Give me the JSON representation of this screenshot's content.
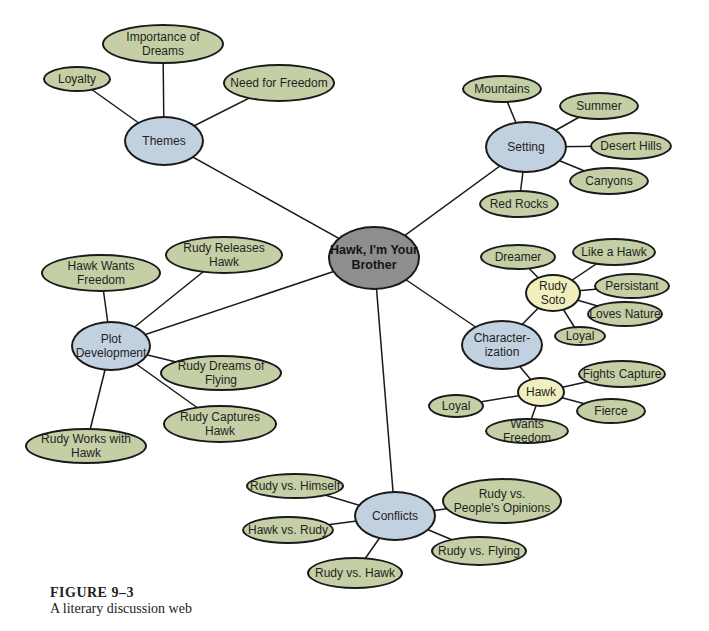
{
  "center": {
    "label": "Hawk, I'm Your\nBrother",
    "x": 374,
    "y": 258,
    "w": 92,
    "h": 64
  },
  "hubs": [
    {
      "id": "themes",
      "label": "Themes",
      "x": 164,
      "y": 141,
      "w": 80,
      "h": 50,
      "color": "hub"
    },
    {
      "id": "setting",
      "label": "Setting",
      "x": 526,
      "y": 147,
      "w": 82,
      "h": 52,
      "color": "hub"
    },
    {
      "id": "plot",
      "label": "Plot\nDevelopment",
      "x": 111,
      "y": 346,
      "w": 80,
      "h": 50,
      "color": "hub"
    },
    {
      "id": "characterization",
      "label": "Character-\nization",
      "x": 502,
      "y": 345,
      "w": 82,
      "h": 50,
      "color": "hub"
    },
    {
      "id": "conflicts",
      "label": "Conflicts",
      "x": 395,
      "y": 516,
      "w": 82,
      "h": 50,
      "color": "hub"
    },
    {
      "id": "rudy-soto",
      "label": "Rudy\nSoto",
      "x": 553,
      "y": 293,
      "w": 56,
      "h": 38,
      "color": "sub"
    },
    {
      "id": "hawk",
      "label": "Hawk",
      "x": 541,
      "y": 392,
      "w": 48,
      "h": 30,
      "color": "sub"
    }
  ],
  "leaves": [
    {
      "parent": "themes",
      "label": "Importance of Dreams",
      "x": 163,
      "y": 44,
      "w": 122,
      "h": 40
    },
    {
      "parent": "themes",
      "label": "Loyalty",
      "x": 77,
      "y": 79,
      "w": 68,
      "h": 26
    },
    {
      "parent": "themes",
      "label": "Need for Freedom",
      "x": 279,
      "y": 83,
      "w": 112,
      "h": 38
    },
    {
      "parent": "setting",
      "label": "Mountains",
      "x": 502,
      "y": 89,
      "w": 80,
      "h": 28
    },
    {
      "parent": "setting",
      "label": "Summer",
      "x": 599,
      "y": 106,
      "w": 80,
      "h": 28
    },
    {
      "parent": "setting",
      "label": "Desert Hills",
      "x": 631,
      "y": 146,
      "w": 82,
      "h": 28
    },
    {
      "parent": "setting",
      "label": "Canyons",
      "x": 609,
      "y": 181,
      "w": 80,
      "h": 28
    },
    {
      "parent": "setting",
      "label": "Red Rocks",
      "x": 519,
      "y": 204,
      "w": 80,
      "h": 28
    },
    {
      "parent": "rudy-soto",
      "label": "Dreamer",
      "x": 518,
      "y": 257,
      "w": 76,
      "h": 26
    },
    {
      "parent": "rudy-soto",
      "label": "Like a Hawk",
      "x": 614,
      "y": 252,
      "w": 84,
      "h": 28
    },
    {
      "parent": "rudy-soto",
      "label": "Persistant",
      "x": 632,
      "y": 286,
      "w": 76,
      "h": 26
    },
    {
      "parent": "rudy-soto",
      "label": "Loves Nature",
      "x": 625,
      "y": 314,
      "w": 76,
      "h": 26
    },
    {
      "parent": "rudy-soto",
      "label": "Loyal",
      "x": 580,
      "y": 336,
      "w": 52,
      "h": 20
    },
    {
      "parent": "hawk",
      "label": "Fights Capture",
      "x": 622,
      "y": 374,
      "w": 88,
      "h": 28
    },
    {
      "parent": "hawk",
      "label": "Fierce",
      "x": 611,
      "y": 411,
      "w": 70,
      "h": 26
    },
    {
      "parent": "hawk",
      "label": "Loyal",
      "x": 456,
      "y": 406,
      "w": 56,
      "h": 24
    },
    {
      "parent": "hawk",
      "label": "Wants Freedom",
      "x": 527,
      "y": 431,
      "w": 84,
      "h": 26
    },
    {
      "parent": "plot",
      "label": "Hawk Wants Freedom",
      "x": 101,
      "y": 273,
      "w": 120,
      "h": 38
    },
    {
      "parent": "plot",
      "label": "Rudy Releases Hawk",
      "x": 224,
      "y": 255,
      "w": 118,
      "h": 38
    },
    {
      "parent": "plot",
      "label": "Rudy Dreams of Flying",
      "x": 221,
      "y": 373,
      "w": 122,
      "h": 36
    },
    {
      "parent": "plot",
      "label": "Rudy Captures Hawk",
      "x": 220,
      "y": 424,
      "w": 114,
      "h": 38
    },
    {
      "parent": "plot",
      "label": "Rudy Works with Hawk",
      "x": 86,
      "y": 446,
      "w": 122,
      "h": 36
    },
    {
      "parent": "conflicts",
      "label": "Rudy vs. Himself",
      "x": 295,
      "y": 486,
      "w": 98,
      "h": 26
    },
    {
      "parent": "conflicts",
      "label": "Hawk vs. Rudy",
      "x": 288,
      "y": 530,
      "w": 92,
      "h": 28
    },
    {
      "parent": "conflicts",
      "label": "Rudy vs. Flying",
      "x": 479,
      "y": 551,
      "w": 96,
      "h": 30
    },
    {
      "parent": "conflicts",
      "label": "Rudy vs. Hawk",
      "x": 355,
      "y": 573,
      "w": 96,
      "h": 32
    },
    {
      "parent": "conflicts",
      "label": "Rudy  vs.\nPeople's Opinions",
      "x": 502,
      "y": 501,
      "w": 120,
      "h": 46
    }
  ],
  "hub_links": [
    "themes",
    "setting",
    "plot",
    "characterization",
    "conflicts"
  ],
  "sub_links": [
    {
      "from": "characterization",
      "to": "rudy-soto"
    },
    {
      "from": "characterization",
      "to": "hawk"
    }
  ],
  "colors": {
    "leaf": "#c5cfa5",
    "hub": "#c2d1e0",
    "sub": "#f0efbd",
    "center": "#8e8e8e",
    "line": "#1a1a1a"
  },
  "caption": {
    "figure": "FIGURE  9–3",
    "text": "A literary discussion web"
  }
}
